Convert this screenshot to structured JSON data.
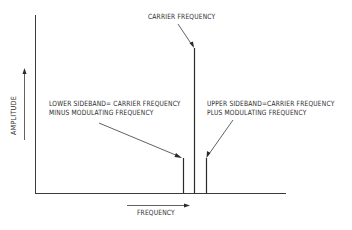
{
  "diagram": {
    "y_axis_label": "AMPLITUDE",
    "x_axis_label": "FREQUENCY",
    "carrier_label": "CARRIER FREQUENCY",
    "lower_sideband": {
      "line1": "LOWER SIDEBAND= CARRIER FREQUENCY",
      "line2": "MINUS MODULATING FREQUENCY"
    },
    "upper_sideband": {
      "line1": "UPPER SIDEBAND=CARRIER FREQUENCY",
      "line2": "PLUS MODULATING FREQUENCY"
    },
    "spectral_lines": [
      {
        "name": "lower-sideband",
        "x": 183,
        "top": 158
      },
      {
        "name": "carrier",
        "x": 194,
        "top": 48
      },
      {
        "name": "upper-sideband",
        "x": 206,
        "top": 158
      }
    ],
    "colors": {
      "line": "#3a3a3a",
      "text": "#2a2a2a",
      "background": "#ffffff"
    }
  }
}
